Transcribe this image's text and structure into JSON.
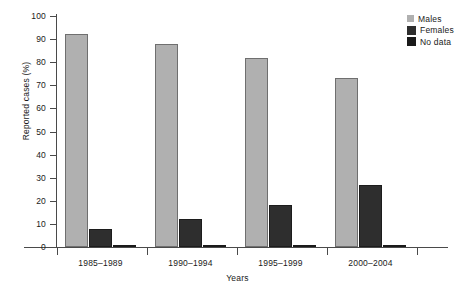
{
  "chart_data": {
    "type": "bar",
    "title": "",
    "xlabel": "Years",
    "ylabel": "Reported cases (%)",
    "ylim": [
      0,
      100
    ],
    "yticks": [
      0,
      10,
      20,
      30,
      40,
      50,
      60,
      70,
      80,
      90,
      100
    ],
    "ytick_labels": [
      "0",
      "10",
      "20",
      "30",
      "40",
      "50",
      "60",
      "70",
      "80",
      "90",
      "100"
    ],
    "grid": false,
    "legend_position": "top-right",
    "categories": [
      "1985–1989",
      "1990–1994",
      "1995–1999",
      "2000–2004"
    ],
    "series": [
      {
        "name": "Males",
        "color": "#b0b0b0",
        "values": [
          92,
          88,
          82,
          73
        ]
      },
      {
        "name": "Females",
        "color": "#2e2e2e",
        "values": [
          8,
          12,
          18,
          27
        ]
      },
      {
        "name": "No data",
        "color": "#1a1a1a",
        "values": [
          0.5,
          1,
          1,
          0.5
        ]
      }
    ]
  },
  "legend": {
    "items": [
      {
        "label": "Males",
        "swatch": "legend-swatch-males"
      },
      {
        "label": "Females",
        "swatch": "legend-swatch-females"
      },
      {
        "label": "No data",
        "swatch": "legend-swatch-no-data"
      }
    ]
  }
}
